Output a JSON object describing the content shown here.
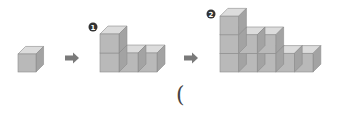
{
  "colors": {
    "front": "#b9b9b9",
    "top": "#dcdcdc",
    "side": "#a3a3a3",
    "edge": "#8c8c8c",
    "arrow": "#7a7a7a",
    "badge": "#333333",
    "badge_text": "#ffffff"
  },
  "figures": [
    {
      "id": "start",
      "label": "",
      "x": 18,
      "base_y": 72,
      "cube": 18,
      "columns": [
        1
      ]
    },
    {
      "id": "step1",
      "label": "1",
      "x": 100,
      "base_y": 72,
      "cube": 19,
      "columns": [
        2,
        1,
        1
      ],
      "badge": {
        "x": 93,
        "y": 27
      }
    },
    {
      "id": "step2",
      "label": "2",
      "x": 220,
      "base_y": 72,
      "cube": 18.6,
      "columns": [
        3,
        2,
        2,
        1,
        1
      ],
      "badge": {
        "x": 211,
        "y": 14
      }
    }
  ],
  "arrows": [
    {
      "x": 65,
      "y": 58
    },
    {
      "x": 184,
      "y": 58
    }
  ],
  "answer_blank": {
    "open_paren": "("
  }
}
